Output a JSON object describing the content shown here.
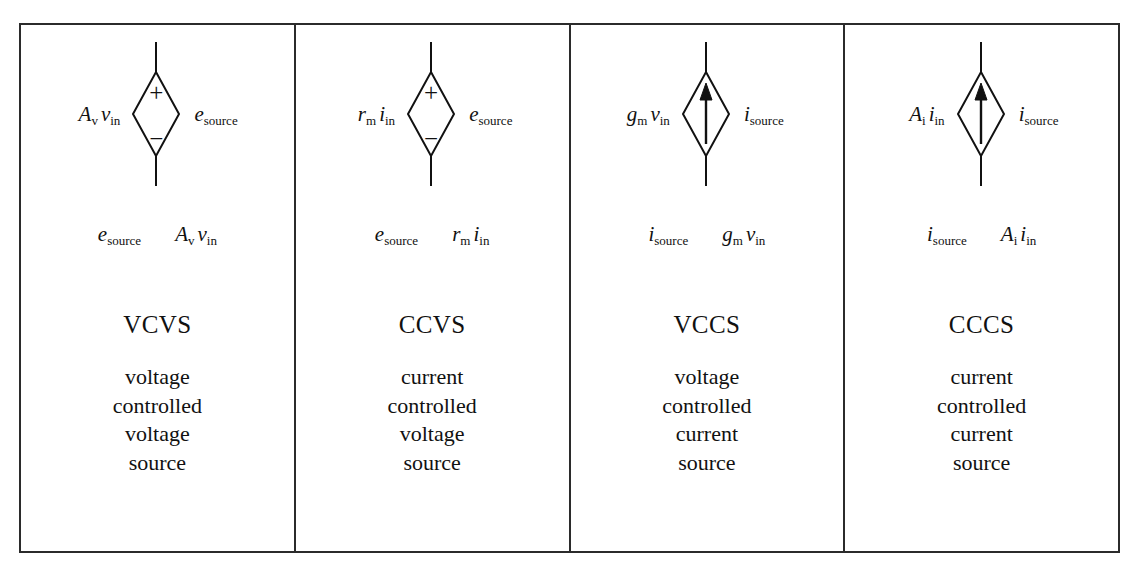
{
  "figure": {
    "border_color": "#2b2b2b",
    "background_color": "#ffffff",
    "text_color": "#111111"
  },
  "columns": [
    {
      "acronym": "VCVS",
      "symbol": {
        "kind": "diamond-voltage-source",
        "plus_sign": "+",
        "minus_sign": "−",
        "has_arrow": false
      },
      "left_label": {
        "base": "A",
        "sub": "v",
        "base2": "v",
        "sub2": "in"
      },
      "right_label": {
        "base": "e",
        "sub": "source"
      },
      "relation": {
        "lhs": {
          "base": "e",
          "sub": "source"
        },
        "rhs": {
          "base": "A",
          "sub": "v",
          "base2": "v",
          "sub2": "in"
        }
      },
      "description": [
        "voltage",
        "controlled",
        "voltage",
        "source"
      ]
    },
    {
      "acronym": "CCVS",
      "symbol": {
        "kind": "diamond-voltage-source",
        "plus_sign": "+",
        "minus_sign": "−",
        "has_arrow": false
      },
      "left_label": {
        "base": "r",
        "sub": "m",
        "base2": "i",
        "sub2": "in"
      },
      "right_label": {
        "base": "e",
        "sub": "source"
      },
      "relation": {
        "lhs": {
          "base": "e",
          "sub": "source"
        },
        "rhs": {
          "base": "r",
          "sub": "m",
          "base2": "i",
          "sub2": "in"
        }
      },
      "description": [
        "current",
        "controlled",
        "voltage",
        "source"
      ]
    },
    {
      "acronym": "VCCS",
      "symbol": {
        "kind": "diamond-current-source",
        "plus_sign": "",
        "minus_sign": "",
        "has_arrow": true
      },
      "left_label": {
        "base": "g",
        "sub": "m",
        "base2": "v",
        "sub2": "in"
      },
      "right_label": {
        "base": "i",
        "sub": "source"
      },
      "relation": {
        "lhs": {
          "base": "i",
          "sub": "source"
        },
        "rhs": {
          "base": "g",
          "sub": "m",
          "base2": "v",
          "sub2": "in"
        }
      },
      "description": [
        "voltage",
        "controlled",
        "current",
        "source"
      ]
    },
    {
      "acronym": "CCCS",
      "symbol": {
        "kind": "diamond-current-source",
        "plus_sign": "",
        "minus_sign": "",
        "has_arrow": true
      },
      "left_label": {
        "base": "A",
        "sub": "i",
        "base2": "i",
        "sub2": "in"
      },
      "right_label": {
        "base": "i",
        "sub": "source"
      },
      "relation": {
        "lhs": {
          "base": "i",
          "sub": "source"
        },
        "rhs": {
          "base": "A",
          "sub": "i",
          "base2": "i",
          "sub2": "in"
        }
      },
      "description": [
        "current",
        "controlled",
        "current",
        "source"
      ]
    }
  ]
}
